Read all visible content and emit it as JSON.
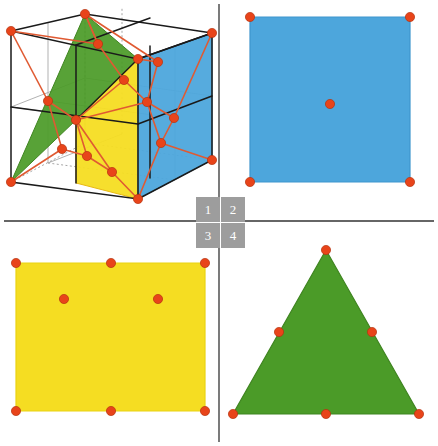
{
  "figure": {
    "width": 438,
    "height": 446,
    "background": "#ffffff"
  },
  "colors": {
    "blue": "#4da6dc",
    "blue_edge": "#3f96cd",
    "yellow": "#f5dd22",
    "yellow_edge": "#e8ce14",
    "green": "#4b9b28",
    "green_edge": "#3f8520",
    "dot": "#e8441a",
    "dot_stroke": "#c23a12",
    "cube_edge": "#1a1a1a",
    "cube_hidden": "#9b9b9b",
    "connector": "#e05a32",
    "divider": "#333333",
    "label_bg": "#9d9d9d",
    "label_fg": "#ffffff"
  },
  "panel_labels": {
    "items": [
      {
        "id": "1",
        "text": "1"
      },
      {
        "id": "2",
        "text": "2"
      },
      {
        "id": "3",
        "text": "3"
      },
      {
        "id": "4",
        "text": "4"
      }
    ]
  },
  "panels": {
    "panel1": {
      "label": "1",
      "name": "cube-with-cross-sections",
      "description": "3D wireframe cube subdivided into octants with blue, yellow and green cross-section planes and an orange-red vertex connectivity graph",
      "cube_vertices": {
        "front_bottom_left": [
          11,
          182
        ],
        "front_bottom_right": [
          138,
          199
        ],
        "front_top_left": [
          11,
          31
        ],
        "front_top_right": [
          138,
          59
        ],
        "back_bottom_left": [
          85,
          143
        ],
        "back_bottom_right": [
          212,
          160
        ],
        "back_top_left": [
          85,
          14
        ],
        "back_top_right": [
          212,
          33
        ]
      },
      "planes": [
        {
          "name": "green-plane",
          "color": "#4b9b28",
          "points": "11,182 85,14 138,59 76,120"
        },
        {
          "name": "yellow-plane",
          "color": "#f5dd22",
          "points": "76,120 138,59 138,199 76,183"
        },
        {
          "name": "blue-plane",
          "color": "#4da6dc",
          "points": "138,59 212,33 212,160 138,199"
        }
      ],
      "graph_nodes": [
        [
          11,
          31
        ],
        [
          85,
          14
        ],
        [
          138,
          59
        ],
        [
          212,
          33
        ],
        [
          98,
          44
        ],
        [
          124,
          80
        ],
        [
          147,
          102
        ],
        [
          11,
          182
        ],
        [
          48,
          101
        ],
        [
          76,
          120
        ],
        [
          62,
          149
        ],
        [
          87,
          156
        ],
        [
          112,
          172
        ],
        [
          138,
          199
        ],
        [
          174,
          118
        ],
        [
          161,
          143
        ],
        [
          212,
          160
        ],
        [
          158,
          62
        ]
      ],
      "node_count": 18
    },
    "panel2": {
      "label": "2",
      "name": "blue-square-cross-section",
      "shape": "square",
      "color": "#4da6dc",
      "vertices": [
        [
          250,
          17
        ],
        [
          410,
          17
        ],
        [
          410,
          182
        ],
        [
          250,
          182
        ]
      ],
      "dots": [
        {
          "role": "corner",
          "x": 250,
          "y": 17
        },
        {
          "role": "corner",
          "x": 410,
          "y": 17
        },
        {
          "role": "corner",
          "x": 410,
          "y": 182
        },
        {
          "role": "corner",
          "x": 250,
          "y": 182
        },
        {
          "role": "center",
          "x": 330,
          "y": 104
        }
      ],
      "dot_count": 5
    },
    "panel3": {
      "label": "3",
      "name": "yellow-rectangle-cross-section",
      "shape": "rectangle",
      "color": "#f5dd22",
      "vertices": [
        [
          16,
          263
        ],
        [
          205,
          263
        ],
        [
          205,
          411
        ],
        [
          16,
          411
        ]
      ],
      "dots": [
        {
          "role": "corner",
          "x": 16,
          "y": 263
        },
        {
          "role": "edge-midpoint-top",
          "x": 111,
          "y": 263
        },
        {
          "role": "corner",
          "x": 205,
          "y": 263
        },
        {
          "role": "interior",
          "x": 64,
          "y": 299
        },
        {
          "role": "interior",
          "x": 158,
          "y": 299
        },
        {
          "role": "corner",
          "x": 16,
          "y": 411
        },
        {
          "role": "edge-midpoint-bottom",
          "x": 111,
          "y": 411
        },
        {
          "role": "corner",
          "x": 205,
          "y": 411
        }
      ],
      "dot_count": 8
    },
    "panel4": {
      "label": "4",
      "name": "green-triangle-cross-section",
      "shape": "triangle",
      "color": "#4b9b28",
      "vertices": [
        [
          326,
          250
        ],
        [
          419,
          414
        ],
        [
          233,
          414
        ]
      ],
      "dots": [
        {
          "role": "apex",
          "x": 326,
          "y": 250
        },
        {
          "role": "edge-midpoint-left",
          "x": 279,
          "y": 332
        },
        {
          "role": "edge-midpoint-right",
          "x": 372,
          "y": 332
        },
        {
          "role": "corner-bottom-left",
          "x": 233,
          "y": 414
        },
        {
          "role": "edge-midpoint-bottom",
          "x": 326,
          "y": 414
        },
        {
          "role": "corner-bottom-right",
          "x": 419,
          "y": 414
        }
      ],
      "dot_count": 6
    }
  },
  "dividers": {
    "vertical": {
      "x": 219,
      "y1": 4,
      "y2": 442
    },
    "horizontal": {
      "y": 221,
      "x1": 4,
      "x2": 434
    }
  }
}
